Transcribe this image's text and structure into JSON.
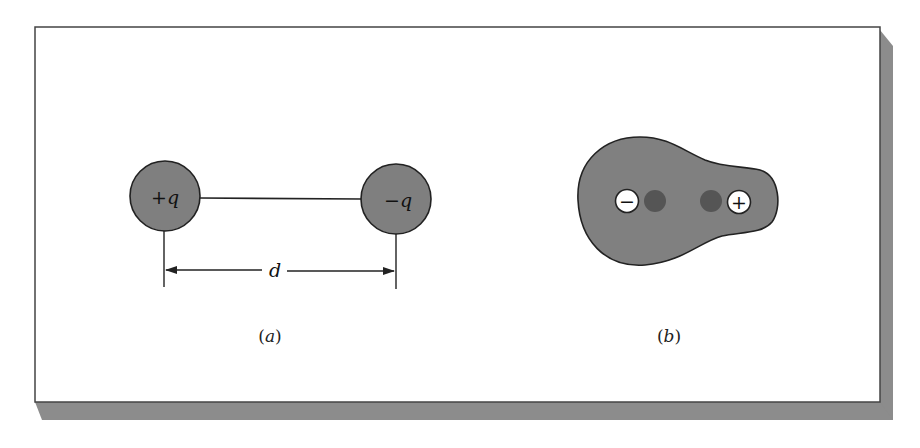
{
  "figure": {
    "colors": {
      "background": "#ffffff",
      "frame_border": "#444444",
      "shadow": "#8c8c8c",
      "charge_fill": "#7f7f7f",
      "molecule_fill": "#808080",
      "nucleus_fill": "#555555",
      "ion_fill": "#ffffff",
      "stroke": "#222222"
    },
    "panel_a": {
      "caption_open": "(",
      "caption_letter": "a",
      "caption_close": ")",
      "positive_charge": {
        "sign": "+",
        "symbol": "q"
      },
      "negative_charge": {
        "sign": "−",
        "symbol": "q"
      },
      "distance_label": "d"
    },
    "panel_b": {
      "caption_open": "(",
      "caption_letter": "b",
      "caption_close": ")",
      "negative_ion_sign": "−",
      "positive_ion_sign": "+"
    }
  }
}
